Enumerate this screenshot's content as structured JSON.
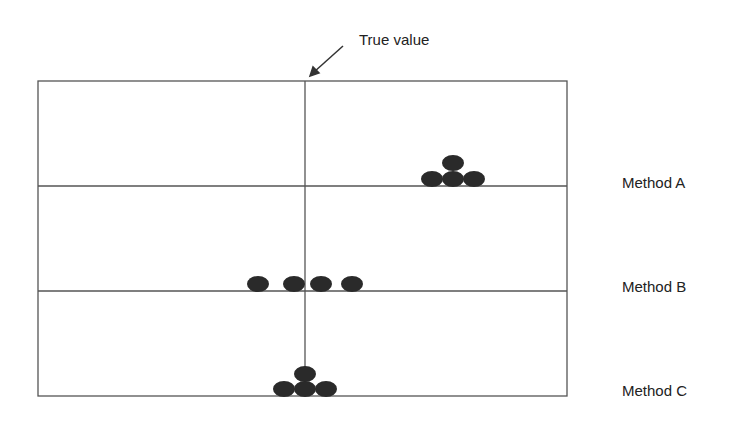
{
  "annotation": {
    "label": "True value",
    "x": 305
  },
  "rows": [
    {
      "label": "Method A",
      "dots": [
        [
          432,
          179
        ],
        [
          453,
          179
        ],
        [
          474,
          179
        ],
        [
          453,
          163
        ]
      ]
    },
    {
      "label": "Method B",
      "dots": [
        [
          258,
          284
        ],
        [
          294,
          284
        ],
        [
          321,
          284
        ],
        [
          352,
          284
        ]
      ]
    },
    {
      "label": "Method C",
      "dots": [
        [
          284,
          389
        ],
        [
          305,
          389
        ],
        [
          326,
          389
        ],
        [
          305,
          374
        ]
      ]
    }
  ],
  "colors": {
    "line": "#555555",
    "dot": "#2a2a2a"
  }
}
